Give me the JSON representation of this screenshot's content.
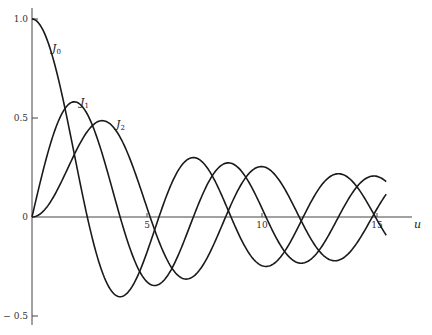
{
  "chart_data": {
    "type": "line",
    "title": "",
    "xlabel": "u",
    "ylabel": "",
    "xlim": [
      0,
      15.5
    ],
    "ylim": [
      -0.55,
      1.05
    ],
    "grid": false,
    "legend": "inline labels",
    "x_ticks": [
      {
        "value": 5,
        "label": "5"
      },
      {
        "value": 10,
        "label": "10"
      },
      {
        "value": 15,
        "label": "15"
      }
    ],
    "y_ticks": [
      {
        "value": 1.0,
        "label": "1.0"
      },
      {
        "value": 0.5,
        "label": "0.5"
      },
      {
        "value": 0,
        "label": "0"
      },
      {
        "value": -0.5,
        "label": "− 0.5"
      }
    ],
    "x": [
      0,
      1,
      2,
      3,
      4,
      5,
      6,
      7,
      8,
      9,
      10,
      11,
      12,
      13,
      14,
      15
    ],
    "series": [
      {
        "name": "J0",
        "label": "J",
        "subscript": "0",
        "order": 0,
        "values": [
          1.0,
          0.7652,
          0.2239,
          -0.2601,
          -0.3971,
          -0.1776,
          0.1506,
          0.3001,
          0.1717,
          -0.0903,
          -0.2459,
          -0.1712,
          0.0477,
          0.2069,
          0.1711,
          -0.0142
        ]
      },
      {
        "name": "J1",
        "label": "J",
        "subscript": "1",
        "order": 1,
        "values": [
          0.0,
          0.4401,
          0.5767,
          0.3391,
          -0.066,
          -0.3276,
          -0.2767,
          -0.0047,
          0.2346,
          0.2453,
          0.0435,
          -0.1768,
          -0.2234,
          -0.0703,
          0.1334,
          0.2051
        ]
      },
      {
        "name": "J2",
        "label": "J",
        "subscript": "2",
        "order": 2,
        "values": [
          0.0,
          0.1149,
          0.3528,
          0.4861,
          0.3641,
          0.0466,
          -0.2429,
          -0.3014,
          -0.113,
          0.1448,
          0.2546,
          0.139,
          -0.0849,
          -0.2177,
          -0.152,
          0.0416
        ]
      }
    ],
    "annotations": [
      {
        "text": "J0",
        "x_px": 52,
        "y_px": 52
      },
      {
        "text": "J1",
        "x_px": 80,
        "y_px": 106
      },
      {
        "text": "J2",
        "x_px": 116,
        "y_px": 128
      }
    ]
  },
  "colors": {
    "curve": "#1a1a1a",
    "axis": "#444444",
    "background": "#ffffff"
  }
}
